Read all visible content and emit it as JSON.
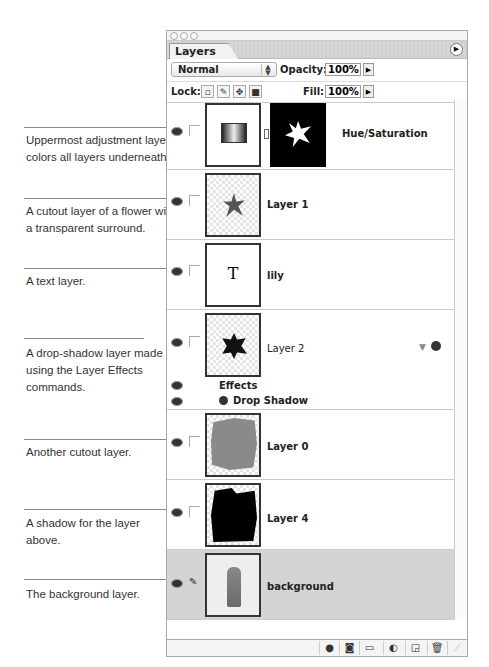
{
  "panel": {
    "tab_label": "Layers",
    "blend_mode": "Normal",
    "opacity_label": "Opacity:",
    "opacity_value": "100%",
    "lock_label": "Lock:",
    "fill_label": "Fill:",
    "fill_value": "100%",
    "lock_icons": [
      "lock-transparent-icon",
      "lock-paint-icon",
      "lock-move-icon",
      "lock-all-icon"
    ]
  },
  "layers": [
    {
      "name": "Hue/Saturation",
      "type": "adjustment",
      "visible": true
    },
    {
      "name": "Layer 1",
      "type": "cutout",
      "visible": true
    },
    {
      "name": "lily",
      "type": "text",
      "visible": true
    },
    {
      "name": "Layer 2",
      "type": "effects",
      "visible": true,
      "effects_label": "Effects",
      "effect_name": "Drop Shadow"
    },
    {
      "name": "Layer 0",
      "type": "cutout",
      "visible": true
    },
    {
      "name": "Layer 4",
      "type": "shadow",
      "visible": true
    },
    {
      "name": "background",
      "type": "background",
      "visible": true,
      "selected": true
    }
  ],
  "annotations": [
    "Uppermost adjustment layer colors all layers underneath.",
    "A cutout layer of a flower with a transparent surround.",
    "A text layer.",
    "A drop-shadow layer made using the Layer Effects commands.",
    "Another cutout layer.",
    "A shadow for the layer above.",
    "The background layer."
  ],
  "text_thumb_glyph": "T",
  "footer_buttons": [
    "layer-style-icon",
    "add-mask-icon",
    "new-group-icon",
    "new-adjustment-icon",
    "new-layer-icon",
    "trash-icon"
  ]
}
